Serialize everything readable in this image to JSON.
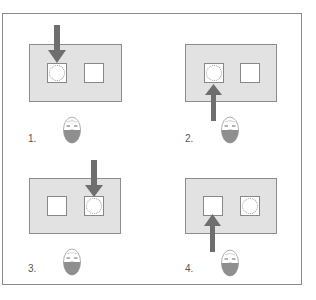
{
  "figure": {
    "steps": [
      {
        "number": "1.",
        "label_text": "1.",
        "open_slot": "left",
        "arrow": "down",
        "arrow_target": "left",
        "face_state": "reclined"
      },
      {
        "number": "2.",
        "label_text": "2.",
        "open_slot": "left",
        "arrow": "up",
        "arrow_target": "left",
        "face_state": "reclined"
      },
      {
        "number": "3.",
        "label_text": "3.",
        "open_slot": "right",
        "arrow": "down",
        "arrow_target": "right",
        "face_state": "reclined"
      },
      {
        "number": "4.",
        "label_text": "4.",
        "open_slot": "right",
        "arrow": "up",
        "arrow_target": "left",
        "face_state": "reclined"
      }
    ],
    "colors": {
      "panel_fill": "#e2e2e2",
      "arrow": "#6e6e6e",
      "face_lower": "#8f8f8f",
      "border": "#8a8a8a"
    }
  }
}
